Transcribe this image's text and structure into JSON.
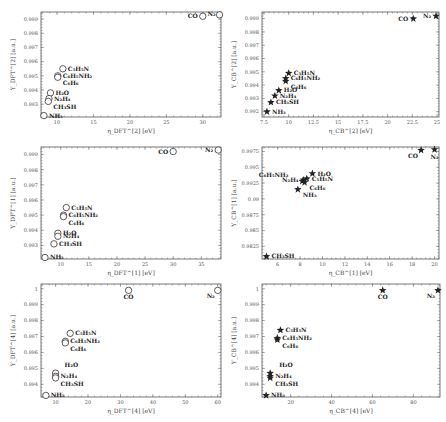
{
  "chart_data": [
    {
      "panel": "top-left",
      "type": "scatter",
      "marker": "circle",
      "xlabel": "η_DFT^[2] [eV]",
      "ylabel": "Y_DFT^[2] [a.u.]",
      "xlim": [
        7.8,
        32.5
      ],
      "ylim": [
        0.9921,
        0.9995
      ],
      "xticks": [
        10,
        15,
        20,
        25,
        30
      ],
      "xtick_labels": [
        "10",
        "15",
        "20",
        "25",
        "30"
      ],
      "yticks": [
        0.993,
        0.994,
        0.995,
        0.996,
        0.997,
        0.998,
        0.999
      ],
      "ytick_labels": [
        "0.993",
        "0.994",
        "0.995",
        "0.996",
        "0.997",
        "0.998",
        "0.999"
      ],
      "frame": {
        "x": 41,
        "y": 12,
        "w": 180,
        "h": 105
      },
      "points": [
        {
          "label": "CO",
          "x": 30.0,
          "y": 0.9992,
          "label_pos": "left"
        },
        {
          "label": "N₂",
          "x": 32.3,
          "y": 0.9993,
          "label_pos": "left-top"
        },
        {
          "label": "C₅H₅N",
          "x": 10.8,
          "y": 0.9955,
          "label_pos": "right"
        },
        {
          "label": "C₆H₅NH₂",
          "x": 10.1,
          "y": 0.995,
          "label_pos": "right"
        },
        {
          "label": "C₆H₆",
          "x": 10.1,
          "y": 0.9949,
          "label_pos": "right-below"
        },
        {
          "label": "H₂O",
          "x": 9.1,
          "y": 0.9938,
          "label_pos": "right"
        },
        {
          "label": "N₂H₄",
          "x": 8.9,
          "y": 0.9934,
          "label_pos": "right"
        },
        {
          "label": "CH₃SH",
          "x": 8.8,
          "y": 0.9932,
          "label_pos": "right-below"
        },
        {
          "label": "NH₃",
          "x": 8.2,
          "y": 0.9922,
          "label_pos": "right"
        }
      ]
    },
    {
      "panel": "top-right",
      "type": "scatter",
      "marker": "star",
      "xlabel": "η_CB^[2] [eV]",
      "ylabel": "Y_CB^[2] [a.u.]",
      "xlim": [
        7.3,
        25.2
      ],
      "ylim": [
        0.9916,
        0.9995
      ],
      "xticks": [
        7.5,
        10,
        12.5,
        15,
        17.5,
        20,
        22.5,
        25
      ],
      "xtick_labels": [
        "7.5",
        "10",
        "12.5",
        "15",
        "17.5",
        "20",
        "22.5",
        "25"
      ],
      "yticks": [
        0.992,
        0.993,
        0.994,
        0.995,
        0.996,
        0.997,
        0.998,
        0.999
      ],
      "ytick_labels": [
        "0.992",
        "0.993",
        "0.994",
        "0.995",
        "0.996",
        "0.997",
        "0.998",
        "0.999"
      ],
      "frame": {
        "x": 262,
        "y": 12,
        "w": 177,
        "h": 105
      },
      "points": [
        {
          "label": "CO",
          "x": 22.6,
          "y": 0.999,
          "label_pos": "left"
        },
        {
          "label": "N₂",
          "x": 24.9,
          "y": 0.9992,
          "label_pos": "left"
        },
        {
          "label": "C₅H₅N",
          "x": 10.0,
          "y": 0.9949,
          "label_pos": "right"
        },
        {
          "label": "C₆H₅NH₂",
          "x": 9.7,
          "y": 0.9945,
          "label_pos": "right"
        },
        {
          "label": "C₆H₆",
          "x": 9.7,
          "y": 0.9943,
          "label_pos": "right-below"
        },
        {
          "label": "H₂O",
          "x": 9.0,
          "y": 0.9936,
          "label_pos": "right"
        },
        {
          "label": "N₂H₄",
          "x": 8.6,
          "y": 0.9932,
          "label_pos": "right"
        },
        {
          "label": "CH₃SH",
          "x": 8.2,
          "y": 0.9927,
          "label_pos": "right"
        },
        {
          "label": "NH₃",
          "x": 7.8,
          "y": 0.992,
          "label_pos": "right"
        }
      ]
    },
    {
      "panel": "middle-left",
      "type": "scatter",
      "marker": "circle",
      "xlabel": "η_DFT^[1] [eV]",
      "ylabel": "Y_DFT^[1] [a.u.]",
      "xlim": [
        6.5,
        38.5
      ],
      "ylim": [
        0.9921,
        0.9995
      ],
      "xticks": [
        10,
        15,
        20,
        25,
        30,
        35
      ],
      "xtick_labels": [
        "10",
        "15",
        "20",
        "25",
        "30",
        "35"
      ],
      "yticks": [
        0.993,
        0.994,
        0.995,
        0.996,
        0.997,
        0.998,
        0.999
      ],
      "ytick_labels": [
        "0.993",
        "0.994",
        "0.995",
        "0.996",
        "0.997",
        "0.998",
        "0.999"
      ],
      "frame": {
        "x": 41,
        "y": 147,
        "w": 180,
        "h": 112
      },
      "points": [
        {
          "label": "CO",
          "x": 30.0,
          "y": 0.9992,
          "label_pos": "left"
        },
        {
          "label": "N₂",
          "x": 38.0,
          "y": 0.9993,
          "label_pos": "left"
        },
        {
          "label": "C₅H₅N",
          "x": 11.0,
          "y": 0.9955,
          "label_pos": "right"
        },
        {
          "label": "C₆H₅NH₂",
          "x": 10.5,
          "y": 0.995,
          "label_pos": "right"
        },
        {
          "label": "C₆H₆",
          "x": 10.5,
          "y": 0.9949,
          "label_pos": "right-below"
        },
        {
          "label": "H₂O",
          "x": 9.5,
          "y": 0.9938,
          "label_pos": "right"
        },
        {
          "label": "N₂H₄",
          "x": 9.5,
          "y": 0.9936,
          "label_pos": "right"
        },
        {
          "label": "CH₃SH",
          "x": 8.8,
          "y": 0.9931,
          "label_pos": "right"
        },
        {
          "label": "NH₃",
          "x": 7.2,
          "y": 0.9922,
          "label_pos": "right"
        }
      ]
    },
    {
      "panel": "middle-right",
      "type": "scatter",
      "marker": "star",
      "xlabel": "η_CB^[1] [eV]",
      "ylabel": "Y_CB^[1] [a.u.]",
      "xlim": [
        4.6,
        20.4
      ],
      "ylim": [
        0.9805,
        0.9982
      ],
      "xticks": [
        6,
        8,
        10,
        12,
        14,
        16,
        18,
        20
      ],
      "xtick_labels": [
        "6",
        "8",
        "10",
        "12",
        "14",
        "16",
        "18",
        "20"
      ],
      "yticks": [
        0.9825,
        0.985,
        0.9875,
        0.99,
        0.9925,
        0.995,
        0.9975
      ],
      "ytick_labels": [
        "0.9825",
        "0.985",
        "0.9875",
        "0.99",
        "0.9925",
        "0.995",
        "0.9975"
      ],
      "frame": {
        "x": 262,
        "y": 147,
        "w": 177,
        "h": 112
      },
      "points": [
        {
          "label": "CO",
          "x": 18.8,
          "y": 0.9977,
          "label_pos": "left-below"
        },
        {
          "label": "N₂",
          "x": 20.0,
          "y": 0.9978,
          "label_pos": "below"
        },
        {
          "label": "H₂O",
          "x": 9.1,
          "y": 0.994,
          "label_pos": "right"
        },
        {
          "label": "C₆H₅NH₂",
          "x": 8.2,
          "y": 0.9928,
          "label_pos": "left-far"
        },
        {
          "label": "N₂H₄",
          "x": 8.3,
          "y": 0.993,
          "label_pos": "left"
        },
        {
          "label": "C₅H₅N",
          "x": 8.6,
          "y": 0.9932,
          "label_pos": "right"
        },
        {
          "label": "C₆H₆",
          "x": 8.4,
          "y": 0.9926,
          "label_pos": "right-below"
        },
        {
          "label": "NH₃",
          "x": 7.8,
          "y": 0.9915,
          "label_pos": "right-below"
        },
        {
          "label": "CH₃SH",
          "x": 5.0,
          "y": 0.9809,
          "label_pos": "right"
        }
      ]
    },
    {
      "panel": "bottom-left",
      "type": "scatter",
      "marker": "circle",
      "xlabel": "η_DFT^[4] [eV]",
      "ylabel": "Y_DFT^[4] [a.u.]",
      "xlim": [
        5.5,
        61
      ],
      "ylim": [
        0.9932,
        1.0003
      ],
      "xticks": [
        10,
        20,
        30,
        40,
        50,
        60
      ],
      "xtick_labels": [
        "10",
        "20",
        "30",
        "40",
        "50",
        "60"
      ],
      "yticks": [
        0.994,
        0.995,
        0.996,
        0.997,
        0.998,
        0.999,
        1.0
      ],
      "ytick_labels": [
        "0.994",
        "0.995",
        "0.996",
        "0.997",
        "0.998",
        "0.999",
        "1"
      ],
      "frame": {
        "x": 41,
        "y": 284,
        "w": 180,
        "h": 113
      },
      "points": [
        {
          "label": "CO",
          "x": 32.5,
          "y": 0.9999,
          "label_pos": "below"
        },
        {
          "label": "N₂",
          "x": 60.0,
          "y": 0.9999,
          "label_pos": "left-below"
        },
        {
          "label": "C₅H₅N",
          "x": 14.5,
          "y": 0.9972,
          "label_pos": "right"
        },
        {
          "label": "C₆H₅NH₂",
          "x": 13.0,
          "y": 0.9967,
          "label_pos": "right"
        },
        {
          "label": "C₆H₆",
          "x": 13.0,
          "y": 0.9966,
          "label_pos": "right-below"
        },
        {
          "label": "H₂O",
          "x": 10.0,
          "y": 0.9947,
          "label_pos": "right-top"
        },
        {
          "label": "N₂H₄",
          "x": 10.0,
          "y": 0.9945,
          "label_pos": "right"
        },
        {
          "label": "CH₃SH",
          "x": 10.0,
          "y": 0.9944,
          "label_pos": "right-below"
        },
        {
          "label": "NH₃",
          "x": 7.0,
          "y": 0.9933,
          "label_pos": "right"
        }
      ]
    },
    {
      "panel": "bottom-right",
      "type": "scatter",
      "marker": "star",
      "xlabel": "η_CB^[4] [eV]",
      "ylabel": "Y_CB^[4] [a.u.]",
      "xlim": [
        6,
        93
      ],
      "ylim": [
        0.9932,
        1.0003
      ],
      "xticks": [
        20,
        40,
        60,
        80
      ],
      "xtick_labels": [
        "20",
        "40",
        "60",
        "80"
      ],
      "yticks": [
        0.994,
        0.995,
        0.996,
        0.997,
        0.998,
        0.999,
        1.0
      ],
      "ytick_labels": [
        "0.994",
        "0.995",
        "0.996",
        "0.997",
        "0.998",
        "0.999",
        "1"
      ],
      "frame": {
        "x": 262,
        "y": 284,
        "w": 178,
        "h": 113
      },
      "points": [
        {
          "label": "CO",
          "x": 65.0,
          "y": 0.9999,
          "label_pos": "below"
        },
        {
          "label": "N₂",
          "x": 92.0,
          "y": 0.9999,
          "label_pos": "left-below"
        },
        {
          "label": "C₅H₅N",
          "x": 15.0,
          "y": 0.9974,
          "label_pos": "right"
        },
        {
          "label": "C₆H₅NH₂",
          "x": 13.5,
          "y": 0.9969,
          "label_pos": "right"
        },
        {
          "label": "C₆H₆",
          "x": 13.5,
          "y": 0.9968,
          "label_pos": "right-below"
        },
        {
          "label": "H₂O",
          "x": 10.0,
          "y": 0.9947,
          "label_pos": "right-top"
        },
        {
          "label": "N₂H₄",
          "x": 10.0,
          "y": 0.9945,
          "label_pos": "right"
        },
        {
          "label": "CH₃SH",
          "x": 10.0,
          "y": 0.9944,
          "label_pos": "right-below"
        },
        {
          "label": "NH₃",
          "x": 8.0,
          "y": 0.9933,
          "label_pos": "right"
        }
      ]
    }
  ]
}
